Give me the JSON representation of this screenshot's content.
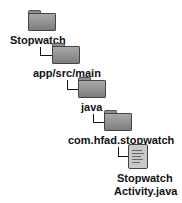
{
  "tree": {
    "nodes": [
      {
        "type": "folder",
        "label": "Stopwatch",
        "icon": "folder-icon"
      },
      {
        "type": "folder",
        "label": "app/src/main",
        "icon": "folder-icon"
      },
      {
        "type": "folder",
        "label": "java",
        "icon": "folder-icon"
      },
      {
        "type": "folder",
        "label": "com.hfad.stopwatch",
        "icon": "folder-icon"
      },
      {
        "type": "file",
        "label_line1": "Stopwatch",
        "label_line2": "Activity.java",
        "icon": "java-file-icon"
      }
    ],
    "colors": {
      "folder": "#8f8f8f",
      "text": "#111111",
      "connector": "#111111"
    }
  }
}
